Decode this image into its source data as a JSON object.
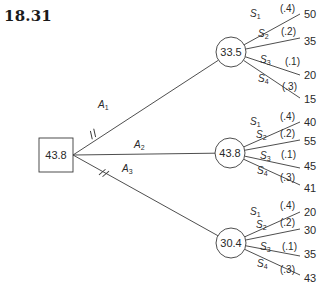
{
  "title": "18.31",
  "decision_node": {
    "value": "43.8",
    "x": 39,
    "y": 138,
    "w": 34,
    "h": 34
  },
  "alternatives": [
    {
      "label": "A",
      "sub": "1",
      "pruned": true,
      "label_pos": [
        98,
        108
      ],
      "mark_pos": [
        93,
        134
      ],
      "chance_node": {
        "value": "33.5",
        "cx": 231,
        "cy": 52,
        "r": 15
      },
      "states": [
        {
          "label": "S",
          "sub": "1",
          "prob": "(.4)",
          "payoff": "50",
          "end": [
            300,
            14
          ],
          "label_pos": [
            250,
            17
          ],
          "prob_pos": [
            280,
            12
          ],
          "payoff_pos": [
            304,
            18
          ]
        },
        {
          "label": "S",
          "sub": "2",
          "prob": "(.2)",
          "payoff": "35",
          "end": [
            300,
            38
          ],
          "label_pos": [
            258,
            37
          ],
          "prob_pos": [
            281,
            35
          ],
          "payoff_pos": [
            304,
            45
          ]
        },
        {
          "label": "S",
          "sub": "3",
          "prob": "(.1)",
          "payoff": "20",
          "end": [
            300,
            75
          ],
          "label_pos": [
            260,
            63
          ],
          "prob_pos": [
            285,
            65
          ],
          "payoff_pos": [
            304,
            79
          ]
        },
        {
          "label": "S",
          "sub": "4",
          "prob": "(.3)",
          "payoff": "15",
          "end": [
            300,
            98
          ],
          "label_pos": [
            258,
            82
          ],
          "prob_pos": [
            282,
            90
          ],
          "payoff_pos": [
            304,
            103
          ]
        }
      ]
    },
    {
      "label": "A",
      "sub": "2",
      "pruned": false,
      "label_pos": [
        134,
        148
      ],
      "mark_pos": null,
      "chance_node": {
        "value": "43.8",
        "cx": 230,
        "cy": 153,
        "r": 15
      },
      "states": [
        {
          "label": "S",
          "sub": "1",
          "prob": "(.4)",
          "payoff": "40",
          "end": [
            300,
            122
          ],
          "label_pos": [
            250,
            125
          ],
          "prob_pos": [
            280,
            120
          ],
          "payoff_pos": [
            304,
            126
          ]
        },
        {
          "label": "S",
          "sub": "2",
          "prob": "(.2)",
          "payoff": "55",
          "end": [
            300,
            140
          ],
          "label_pos": [
            256,
            138
          ],
          "prob_pos": [
            280,
            137
          ],
          "payoff_pos": [
            304,
            145
          ]
        },
        {
          "label": "S",
          "sub": "3",
          "prob": "(.1)",
          "payoff": "45",
          "end": [
            300,
            168
          ],
          "label_pos": [
            260,
            159
          ],
          "prob_pos": [
            281,
            158
          ],
          "payoff_pos": [
            304,
            170
          ]
        },
        {
          "label": "S",
          "sub": "4",
          "prob": "(.3)",
          "payoff": "41",
          "end": [
            300,
            185
          ],
          "label_pos": [
            257,
            174
          ],
          "prob_pos": [
            280,
            181
          ],
          "payoff_pos": [
            304,
            192
          ]
        }
      ]
    },
    {
      "label": "A",
      "sub": "3",
      "pruned": true,
      "label_pos": [
        122,
        172
      ],
      "mark_pos": [
        104,
        173
      ],
      "chance_node": {
        "value": "30.4",
        "cx": 231,
        "cy": 243,
        "r": 15
      },
      "states": [
        {
          "label": "S",
          "sub": "1",
          "prob": "(.4)",
          "payoff": "20",
          "end": [
            300,
            212
          ],
          "label_pos": [
            250,
            215
          ],
          "prob_pos": [
            280,
            209
          ],
          "payoff_pos": [
            304,
            216
          ]
        },
        {
          "label": "S",
          "sub": "2",
          "prob": "(.2)",
          "payoff": "30",
          "end": [
            300,
            229
          ],
          "label_pos": [
            256,
            228
          ],
          "prob_pos": [
            280,
            226
          ],
          "payoff_pos": [
            304,
            234
          ]
        },
        {
          "label": "S",
          "sub": "3",
          "prob": "(.1)",
          "payoff": "35",
          "end": [
            300,
            256
          ],
          "label_pos": [
            260,
            250
          ],
          "prob_pos": [
            282,
            250
          ],
          "payoff_pos": [
            304,
            258
          ]
        },
        {
          "label": "S",
          "sub": "4",
          "prob": "(.3)",
          "payoff": "43",
          "end": [
            300,
            275
          ],
          "label_pos": [
            257,
            267
          ],
          "prob_pos": [
            280,
            273
          ],
          "payoff_pos": [
            304,
            282
          ]
        }
      ]
    }
  ],
  "colors": {
    "line": "#3a3a3a",
    "text": "#2a2a2a",
    "background": "#ffffff"
  }
}
